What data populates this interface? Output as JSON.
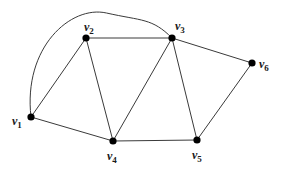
{
  "diagram": {
    "type": "graph",
    "vertices": [
      {
        "id": "v1",
        "label": "v",
        "sub": "1",
        "x": 31,
        "y": 117,
        "lx": 12,
        "ly": 125
      },
      {
        "id": "v2",
        "label": "v",
        "sub": "2",
        "x": 86,
        "y": 38,
        "lx": 84,
        "ly": 31
      },
      {
        "id": "v3",
        "label": "v",
        "sub": "3",
        "x": 172,
        "y": 38,
        "lx": 175,
        "ly": 30
      },
      {
        "id": "v4",
        "label": "v",
        "sub": "4",
        "x": 113,
        "y": 141,
        "lx": 107,
        "ly": 160
      },
      {
        "id": "v5",
        "label": "v",
        "sub": "5",
        "x": 197,
        "y": 140,
        "lx": 192,
        "ly": 159
      },
      {
        "id": "v6",
        "label": "v",
        "sub": "6",
        "x": 252,
        "y": 63,
        "lx": 259,
        "ly": 68
      }
    ],
    "edges": [
      {
        "from": "v1",
        "to": "v2",
        "curve": false
      },
      {
        "from": "v1",
        "to": "v4",
        "curve": false
      },
      {
        "from": "v1",
        "to": "v3",
        "curve": true
      },
      {
        "from": "v2",
        "to": "v3",
        "curve": false
      },
      {
        "from": "v2",
        "to": "v4",
        "curve": false
      },
      {
        "from": "v3",
        "to": "v4",
        "curve": false
      },
      {
        "from": "v3",
        "to": "v5",
        "curve": false
      },
      {
        "from": "v3",
        "to": "v6",
        "curve": false
      },
      {
        "from": "v4",
        "to": "v5",
        "curve": false
      },
      {
        "from": "v5",
        "to": "v6",
        "curve": false
      }
    ],
    "colors": {
      "edge": "#3a3a3a",
      "vertex": "#000000",
      "label": "#1a1a1a",
      "background": "#ffffff"
    }
  }
}
